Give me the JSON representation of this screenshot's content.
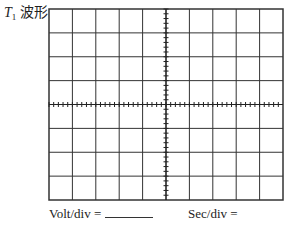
{
  "header": {
    "symbol": "T",
    "subscript": "1",
    "title_suffix": " 波形"
  },
  "grid": {
    "columns": 10,
    "rows": 8,
    "minor_ticks_per_division": 5,
    "line_color": "#333333",
    "axis_color": "#222222"
  },
  "footer": {
    "volt_label": "Volt/div =",
    "sec_label": "Sec/div ="
  }
}
